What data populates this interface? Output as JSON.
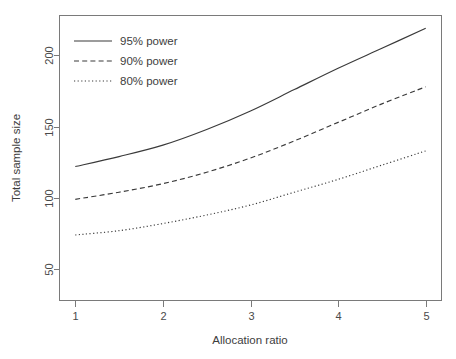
{
  "chart_data": {
    "type": "line",
    "title": "",
    "subtitle": "",
    "xlabel": "Allocation ratio",
    "ylabel": "Total sample size",
    "xlim": [
      0.82,
      5.18
    ],
    "ylim": [
      28,
      228
    ],
    "xticks": [
      1,
      2,
      3,
      4,
      5
    ],
    "xtick_labels": [
      "1",
      "2",
      "3",
      "4",
      "5"
    ],
    "yticks": [
      50,
      100,
      150,
      200
    ],
    "ytick_labels": [
      "50",
      "100",
      "150",
      "200"
    ],
    "grid": false,
    "legend_position": "top-left",
    "x": [
      1,
      1.5,
      2,
      2.5,
      3,
      3.5,
      4,
      4.5,
      5
    ],
    "series": [
      {
        "name": "95% power",
        "style": "solid",
        "color": "#3a3a3a",
        "values": [
          122,
          129,
          137,
          148,
          161,
          176,
          191,
          205,
          219
        ]
      },
      {
        "name": "90% power",
        "style": "dashed",
        "color": "#3a3a3a",
        "values": [
          99,
          104,
          110,
          118,
          128,
          140,
          153,
          166,
          178
        ]
      },
      {
        "name": "80% power",
        "style": "dotted",
        "color": "#3a3a3a",
        "values": [
          74,
          77,
          82,
          88,
          95,
          104,
          113,
          123,
          133
        ]
      }
    ],
    "legend_entries": [
      "95% power",
      "90% power",
      "80% power"
    ]
  },
  "axes": {
    "x_title": "Allocation ratio",
    "y_title": "Total sample size",
    "x_tick_labels": [
      "1",
      "2",
      "3",
      "4",
      "5"
    ],
    "y_tick_labels": [
      "50",
      "100",
      "150",
      "200"
    ]
  },
  "legend": {
    "items": [
      {
        "label": "95% power"
      },
      {
        "label": "90% power"
      },
      {
        "label": "80% power"
      }
    ]
  },
  "colors": {
    "line": "#3a3a3a",
    "axis": "#7a7a7a",
    "text": "#3d3d3d",
    "background": "#ffffff"
  }
}
